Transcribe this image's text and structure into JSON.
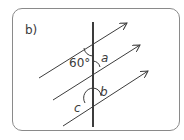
{
  "part_label": "b)",
  "angles": {
    "given": "60°",
    "a": "a",
    "b": "b",
    "c": "c"
  },
  "colors": {
    "line": "#3c3c3c",
    "border": "#8a8a8a",
    "text": "#3a3a3a"
  }
}
